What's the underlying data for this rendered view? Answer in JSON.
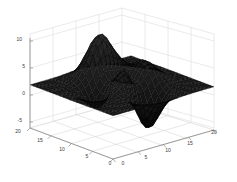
{
  "figure": {
    "title": "",
    "background_color": "#ffffff",
    "axis_color": "#7a7a7a",
    "grid_color": "#d8d8d8",
    "surface_color": "#111111",
    "mesh_color": "#0c0c0c"
  },
  "chart_data": {
    "type": "surface",
    "title": "",
    "xlabel": "",
    "ylabel": "",
    "zlabel": "",
    "grid": true,
    "legend": "none",
    "view": {
      "azimuth": -37.5,
      "elevation": 30
    },
    "x": {
      "label": "",
      "ticks": [
        0,
        5,
        10,
        15,
        20
      ],
      "tick_labels": [
        "0",
        "5",
        "10",
        "15",
        "20"
      ],
      "lim": [
        0,
        20
      ]
    },
    "y": {
      "label": "",
      "ticks": [
        0,
        5,
        10,
        15,
        20
      ],
      "tick_labels": [
        "0",
        "5",
        "10",
        "15",
        "20"
      ],
      "lim": [
        0,
        20
      ]
    },
    "z": {
      "label": "",
      "ticks": [
        -5,
        0,
        5,
        10
      ],
      "tick_labels": [
        "-5",
        "0",
        "5",
        "10"
      ],
      "lim": [
        -8,
        10
      ]
    },
    "function": "peaks",
    "grid_size": {
      "nx": 25,
      "ny": 25
    },
    "z_extrema": {
      "max": 8.1,
      "min": -6.5
    }
  },
  "axes": {
    "z_ticks": [
      {
        "label": "10",
        "x": 22,
        "y": 41
      },
      {
        "label": "5",
        "x": 25,
        "y": 68
      },
      {
        "label": "0",
        "x": 25,
        "y": 95
      },
      {
        "label": "-5",
        "x": 22,
        "y": 122
      }
    ],
    "y_ticks": [
      {
        "label": "20",
        "x": 18,
        "y": 133
      },
      {
        "label": "15",
        "x": 40,
        "y": 142
      },
      {
        "label": "10",
        "x": 62,
        "y": 151
      },
      {
        "label": "5",
        "x": 87,
        "y": 158
      },
      {
        "label": "0",
        "x": 110,
        "y": 165
      }
    ],
    "x_ticks": [
      {
        "label": "0",
        "x": 123,
        "y": 165
      },
      {
        "label": "5",
        "x": 146,
        "y": 159
      },
      {
        "label": "10",
        "x": 168,
        "y": 152
      },
      {
        "label": "15",
        "x": 190,
        "y": 145
      },
      {
        "label": "20",
        "x": 214,
        "y": 134
      }
    ]
  }
}
